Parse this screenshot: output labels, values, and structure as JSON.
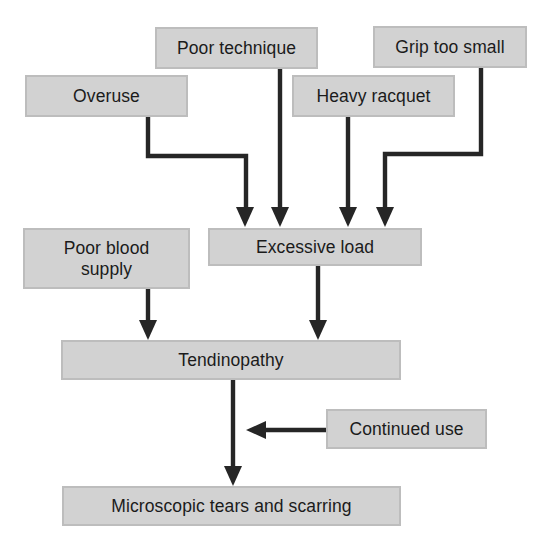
{
  "diagram": {
    "style": {
      "node_fill": "#d2d2d2",
      "node_border": "#bdbdbd",
      "edge_color": "#262626",
      "text_color": "#1b1b1b",
      "background": "#ffffff"
    },
    "nodes": [
      {
        "id": "poor-technique",
        "label": "Poor technique",
        "x": 155,
        "y": 27,
        "w": 163,
        "h": 42
      },
      {
        "id": "grip-too-small",
        "label": "Grip too small",
        "x": 373,
        "y": 26,
        "w": 154,
        "h": 42
      },
      {
        "id": "overuse",
        "label": "Overuse",
        "x": 25,
        "y": 75,
        "w": 163,
        "h": 42
      },
      {
        "id": "heavy-racquet",
        "label": "Heavy racquet",
        "x": 292,
        "y": 75,
        "w": 163,
        "h": 42
      },
      {
        "id": "poor-blood-supply",
        "label": "Poor blood\nsupply",
        "x": 23,
        "y": 228,
        "w": 167,
        "h": 61
      },
      {
        "id": "excessive-load",
        "label": "Excessive load",
        "x": 208,
        "y": 228,
        "w": 214,
        "h": 38
      },
      {
        "id": "tendinopathy",
        "label": "Tendinopathy",
        "x": 61,
        "y": 340,
        "w": 340,
        "h": 40
      },
      {
        "id": "continued-use",
        "label": "Continued use",
        "x": 326,
        "y": 409,
        "w": 161,
        "h": 40
      },
      {
        "id": "microscopic-tears",
        "label": "Microscopic tears and scarring",
        "x": 62,
        "y": 486,
        "w": 339,
        "h": 40
      }
    ],
    "edges": [
      {
        "id": "overuse-to-excessive-load",
        "from": "overuse",
        "to": "excessive-load",
        "route": "elbow-right",
        "path": "M148,117 L148,156 L246,156 L246,212",
        "head": "245,227 236,207 254,207"
      },
      {
        "id": "poor-technique-to-excessive-load",
        "from": "poor-technique",
        "to": "excessive-load",
        "route": "straight",
        "path": "M280,69 L280,212",
        "head": "280,227 271,207 289,207"
      },
      {
        "id": "heavy-racquet-to-excessive-load",
        "from": "heavy-racquet",
        "to": "excessive-load",
        "route": "straight",
        "path": "M348,117 L348,212",
        "head": "348,227 339,207 357,207"
      },
      {
        "id": "grip-to-excessive-load",
        "from": "grip-too-small",
        "to": "excessive-load",
        "route": "elbow-left",
        "path": "M481,68 L481,154 L385,154 L385,212",
        "head": "385,227 376,207 394,207"
      },
      {
        "id": "poor-blood-to-tendinopathy",
        "from": "poor-blood-supply",
        "to": "tendinopathy",
        "route": "straight",
        "path": "M148,289 L148,325",
        "head": "148,340 139,320 157,320"
      },
      {
        "id": "excessive-load-to-tendinopathy",
        "from": "excessive-load",
        "to": "tendinopathy",
        "route": "straight",
        "path": "M318,266 L318,325",
        "head": "318,340 309,320 327,320"
      },
      {
        "id": "tendinopathy-to-microscopic",
        "from": "tendinopathy",
        "to": "microscopic-tears",
        "route": "straight",
        "path": "M233,380 L233,471",
        "head": "233,486 224,466 242,466"
      },
      {
        "id": "continued-use-to-tendinopathy-arrow",
        "from": "continued-use",
        "to": "tendinopathy-arrow",
        "route": "horizontal",
        "path": "M326,430 L261,430",
        "head": "246,430 266,421 266,439"
      }
    ]
  }
}
